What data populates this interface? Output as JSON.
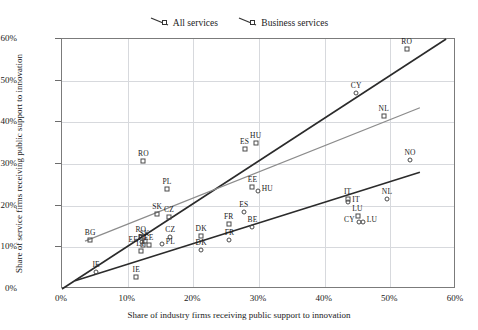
{
  "legend": {
    "position": "top-center",
    "entries": [
      {
        "label": "All services",
        "marker": "square",
        "icon": "line-marker-icon"
      },
      {
        "label": "Business services",
        "marker": "square",
        "icon": "line-marker-icon"
      }
    ]
  },
  "chart_data": {
    "type": "scatter",
    "title": "",
    "xlabel": "Share of industry firms receiving public support to innovation",
    "ylabel": "Share of service firms receiving public support to innovation",
    "xlim": [
      0,
      60
    ],
    "ylim": [
      0,
      60
    ],
    "xticks": [
      "0%",
      "10%",
      "20%",
      "30%",
      "40%",
      "50%",
      "60%"
    ],
    "yticks": [
      "0%",
      "10%",
      "20%",
      "30%",
      "40%",
      "50%",
      "60%"
    ],
    "xtick_values": [
      0,
      10,
      20,
      30,
      40,
      50,
      60
    ],
    "ytick_values": [
      0,
      10,
      20,
      30,
      40,
      50,
      60
    ],
    "grid": true,
    "unit": "percent",
    "series": [
      {
        "name": "All services",
        "marker": "square",
        "color": "#4a4a4a",
        "points": [
          {
            "label": "RO",
            "x": 52.5,
            "y": 57.5,
            "label_pos": "top"
          },
          {
            "label": "NL",
            "x": 49.0,
            "y": 41.5,
            "label_pos": "top"
          },
          {
            "label": "HU",
            "x": 29.5,
            "y": 35.0,
            "label_pos": "top"
          },
          {
            "label": "ES",
            "x": 27.8,
            "y": 33.5,
            "label_pos": "top"
          },
          {
            "label": "RO",
            "x": 12.4,
            "y": 30.8,
            "label_pos": "top"
          },
          {
            "label": "EE",
            "x": 29.0,
            "y": 24.5,
            "label_pos": "top"
          },
          {
            "label": "PL",
            "x": 16.0,
            "y": 24.0,
            "label_pos": "top"
          },
          {
            "label": "IT",
            "x": 43.5,
            "y": 21.5,
            "label_pos": "top"
          },
          {
            "label": "LU",
            "x": 45.0,
            "y": 17.5,
            "label_pos": "top"
          },
          {
            "label": "SK",
            "x": 14.5,
            "y": 18.0,
            "label_pos": "top"
          },
          {
            "label": "CZ",
            "x": 16.3,
            "y": 17.2,
            "label_pos": "top"
          },
          {
            "label": "FR",
            "x": 25.4,
            "y": 15.5,
            "label_pos": "top"
          },
          {
            "label": "DK",
            "x": 21.2,
            "y": 12.8,
            "label_pos": "top"
          },
          {
            "label": "BG",
            "x": 4.3,
            "y": 11.8,
            "label_pos": "top"
          },
          {
            "label": "RO",
            "x": 12.0,
            "y": 12.6,
            "label_pos": "top"
          },
          {
            "label": "SK",
            "x": 12.6,
            "y": 11.6,
            "label_pos": "top"
          },
          {
            "label": "PT",
            "x": 12.3,
            "y": 10.6,
            "label_pos": "top"
          },
          {
            "label": "EE",
            "x": 13.2,
            "y": 10.6,
            "label_pos": "top"
          },
          {
            "label": "LT",
            "x": 12.0,
            "y": 9.2,
            "label_pos": "top"
          },
          {
            "label": "IE",
            "x": 11.3,
            "y": 3.0,
            "label_pos": "top"
          }
        ]
      },
      {
        "name": "Business services",
        "marker": "circle",
        "color": "#4a4a4a",
        "points": [
          {
            "label": "CY",
            "x": 44.8,
            "y": 47.0,
            "label_pos": "top"
          },
          {
            "label": "NO",
            "x": 53.0,
            "y": 31.0,
            "label_pos": "top"
          },
          {
            "label": "HU",
            "x": 29.8,
            "y": 23.5,
            "label_pos": "right"
          },
          {
            "label": "IT",
            "x": 43.6,
            "y": 21.0,
            "label_pos": "right"
          },
          {
            "label": "NL",
            "x": 49.5,
            "y": 21.5,
            "label_pos": "top"
          },
          {
            "label": "ES",
            "x": 27.7,
            "y": 18.4,
            "label_pos": "top"
          },
          {
            "label": "CY",
            "x": 45.2,
            "y": 16.2,
            "label_pos": "left"
          },
          {
            "label": "LU",
            "x": 45.8,
            "y": 16.2,
            "label_pos": "right"
          },
          {
            "label": "BE",
            "x": 29.0,
            "y": 15.0,
            "label_pos": "top"
          },
          {
            "label": "CZ",
            "x": 16.5,
            "y": 12.5,
            "label_pos": "top"
          },
          {
            "label": "FR",
            "x": 25.5,
            "y": 11.8,
            "label_pos": "top"
          },
          {
            "label": "DK",
            "x": 21.2,
            "y": 9.4,
            "label_pos": "top"
          },
          {
            "label": "PL",
            "x": 15.2,
            "y": 10.8,
            "label_pos": "right"
          },
          {
            "label": "EE",
            "x": 12.2,
            "y": 11.2,
            "label_pos": "left"
          },
          {
            "label": "IE",
            "x": 5.2,
            "y": 4.0,
            "label_pos": "top"
          }
        ]
      }
    ],
    "trendlines": [
      {
        "name": "diagonal-reference",
        "color": "#2b2b2b",
        "width": 1.6,
        "x1": 0.0,
        "y1": 0.0,
        "x2": 58.5,
        "y2": 60.0
      },
      {
        "name": "all-services-fit",
        "color": "#8c8c8c",
        "width": 1.3,
        "x1": 3.5,
        "y1": 11.5,
        "x2": 54.5,
        "y2": 43.5
      },
      {
        "name": "business-services-fit",
        "color": "#2b2b2b",
        "width": 1.6,
        "x1": 2.0,
        "y1": 2.0,
        "x2": 54.5,
        "y2": 28.0
      }
    ]
  }
}
